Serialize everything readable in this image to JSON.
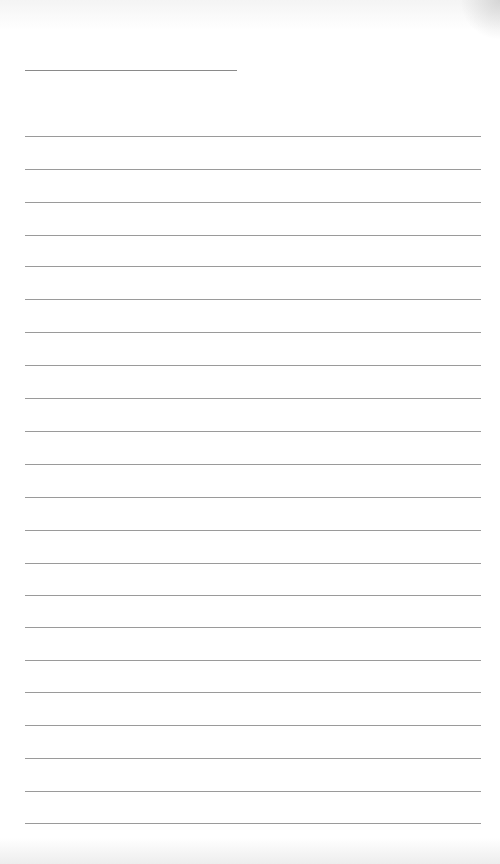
{
  "document": {
    "type": "blank lined paper",
    "title_line": {
      "x1": 25,
      "x2": 237,
      "y": 70,
      "color": "#8a8a8a"
    },
    "ruled_lines": {
      "x1": 25,
      "x2": 481,
      "color": "#9a9a9a",
      "y_positions": [
        136,
        169,
        202,
        235,
        266,
        299,
        332,
        365,
        398,
        431,
        464,
        497,
        530,
        563,
        595,
        627,
        660,
        692,
        725,
        758,
        791,
        823
      ]
    },
    "text_content": []
  }
}
